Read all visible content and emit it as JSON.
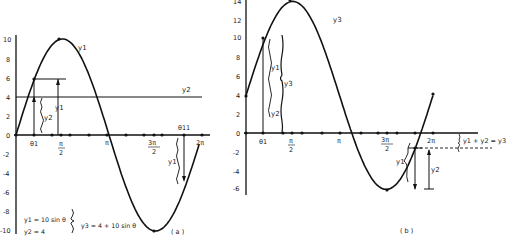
{
  "panel_a": {
    "label": "( a )",
    "y_ticks": [
      "10",
      "8",
      "6",
      "4",
      "2",
      "0",
      "-2",
      "-4",
      "-6",
      "-8",
      "-10"
    ],
    "x_labels": {
      "theta1": "θ1",
      "pi_over_2_num": "π",
      "pi_over_2_den": "2",
      "pi": "π",
      "three_pi_over_2_num": "3π",
      "three_pi_over_2_den": "2",
      "two_pi": "2π",
      "theta11": "θ11"
    },
    "curve_labels": {
      "y1": "y1",
      "y2": "y2"
    },
    "brace_labels": {
      "y2": "y2",
      "y1_up": "y1",
      "y1_down": "y1"
    },
    "equations": {
      "eq1": "y1 = 10 sin θ",
      "eq2": "y2 = 4",
      "eq3": "y3 = 4 + 10 sin θ"
    }
  },
  "panel_b": {
    "label": "( b )",
    "y_ticks": [
      "14",
      "12",
      "10",
      "8",
      "6",
      "4",
      "2",
      "0",
      "-2",
      "-4",
      "-6"
    ],
    "x_labels": {
      "theta1": "θ1",
      "pi_over_2_num": "π",
      "pi_over_2_den": "2",
      "pi": "π",
      "three_pi_over_2_num": "3π",
      "three_pi_over_2_den": "2",
      "two_pi": "2π"
    },
    "curve_labels": {
      "y3": "y3"
    },
    "brace_labels": {
      "y1": "y1",
      "y2": "y2",
      "y3": "y3",
      "y1_low": "y1",
      "y2_low": "y2"
    },
    "sum_label": "y1 + y2 = y3"
  },
  "chart_data": [
    {
      "type": "line",
      "title": "(a)",
      "xlabel": "θ",
      "ylabel": "",
      "ylim": [
        -10,
        10
      ],
      "x_ticks": [
        "θ1",
        "π/2",
        "π",
        "3π/2",
        "θ11",
        "2π"
      ],
      "series": [
        {
          "name": "y1 = 10 sin θ",
          "x": [
            0,
            0.785,
            1.571,
            2.356,
            3.142,
            3.927,
            4.712,
            5.498,
            6.283
          ],
          "values": [
            0,
            7.07,
            10,
            7.07,
            0,
            -7.07,
            -10,
            -7.07,
            0
          ]
        },
        {
          "name": "y2 = 4",
          "x": [
            0,
            6.283
          ],
          "values": [
            4,
            4
          ]
        }
      ],
      "annotations": [
        "y1 = 10 sin θ",
        "y2 = 4",
        "y3 = 4 + 10 sin θ"
      ]
    },
    {
      "type": "line",
      "title": "(b)",
      "xlabel": "θ",
      "ylabel": "",
      "ylim": [
        -6,
        14
      ],
      "x_ticks": [
        "θ1",
        "π/2",
        "π",
        "3π/2",
        "2π"
      ],
      "series": [
        {
          "name": "y3 = 4 + 10 sin θ",
          "x": [
            0,
            0.785,
            1.571,
            2.356,
            3.142,
            3.927,
            4.712,
            5.498,
            6.283
          ],
          "values": [
            4,
            11.07,
            14,
            11.07,
            4,
            -3.07,
            -6,
            -3.07,
            4
          ]
        }
      ],
      "annotations": [
        "y1 + y2 = y3"
      ]
    }
  ]
}
